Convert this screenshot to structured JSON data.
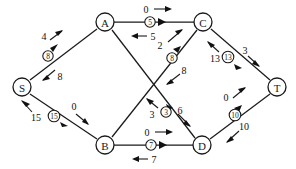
{
  "diagram": {
    "type": "directed-graph",
    "nodes": [
      {
        "id": "S",
        "label": "S",
        "x": 22,
        "y": 87
      },
      {
        "id": "A",
        "label": "A",
        "x": 105,
        "y": 22
      },
      {
        "id": "B",
        "label": "B",
        "x": 105,
        "y": 145
      },
      {
        "id": "C",
        "label": "C",
        "x": 203,
        "y": 22
      },
      {
        "id": "D",
        "label": "D",
        "x": 202,
        "y": 145
      },
      {
        "id": "T",
        "label": "T",
        "x": 277,
        "y": 87
      }
    ],
    "edges": [
      {
        "id": "edge-s-a",
        "from": "S",
        "to": "A",
        "mid_label": "8",
        "mid_x": 48,
        "mid_y": 56,
        "forward_value": "4",
        "forward_x": 44,
        "forward_y": 36,
        "backward_value": "8",
        "backward_x": 60,
        "backward_y": 76
      },
      {
        "id": "edge-s-b",
        "from": "S",
        "to": "B",
        "mid_label": "15",
        "mid_x": 54,
        "mid_y": 116,
        "forward_value": "0",
        "forward_x": 74,
        "forward_y": 108,
        "backward_value": "15",
        "backward_x": 32,
        "backward_y": 119
      },
      {
        "id": "edge-a-c",
        "from": "A",
        "to": "C",
        "mid_label": "5",
        "mid_x": 150,
        "mid_y": 22,
        "forward_value": "0",
        "forward_x": 146,
        "forward_y": 9,
        "backward_value": "5",
        "backward_x": 152,
        "backward_y": 36
      },
      {
        "id": "edge-b-c",
        "from": "B",
        "to": "C",
        "mid_label": "8",
        "mid_x": 172,
        "mid_y": 58,
        "forward_value": "2",
        "forward_x": 161,
        "forward_y": 45,
        "backward_value": "8",
        "backward_x": 182,
        "backward_y": 70
      },
      {
        "id": "edge-a-d",
        "from": "A",
        "to": "D",
        "mid_label": "3",
        "mid_x": 166,
        "mid_y": 112,
        "forward_value": "3",
        "forward_x": 152,
        "forward_y": 112,
        "backward_value": "6",
        "backward_x": 180,
        "backward_y": 110
      },
      {
        "id": "edge-b-d",
        "from": "B",
        "to": "D",
        "mid_label": "7",
        "mid_x": 151,
        "mid_y": 145,
        "forward_value": "0",
        "forward_x": 147,
        "forward_y": 132,
        "backward_value": "7",
        "backward_x": 153,
        "backward_y": 159
      },
      {
        "id": "edge-c-t",
        "from": "C",
        "to": "T",
        "mid_label": "13",
        "mid_x": 228,
        "mid_y": 57,
        "forward_value": "3",
        "forward_x": 245,
        "forward_y": 50,
        "backward_value": "13",
        "backward_x": 212,
        "backward_y": 58
      },
      {
        "id": "edge-d-t",
        "from": "D",
        "to": "T",
        "mid_label": "10",
        "mid_x": 235,
        "mid_y": 115,
        "forward_value": "0",
        "forward_x": 227,
        "forward_y": 99,
        "backward_value": "10",
        "backward_x": 243,
        "backward_y": 126
      }
    ],
    "colors": {
      "stroke": "#1a1a1a",
      "background": "#ffffff",
      "text": "#111111"
    }
  }
}
